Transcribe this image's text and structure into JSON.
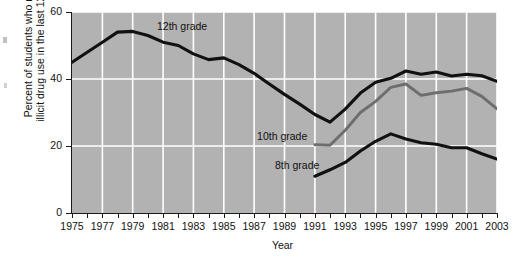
{
  "chart_data": {
    "type": "line",
    "title": "",
    "xlabel": "Year",
    "ylabel": "Percent of students who reported illicit drug use in the last 12 months",
    "ylabel_line1": "Percent of students who reported",
    "ylabel_line2": "illicit drug use in the last 12 months",
    "xlim": [
      1975,
      2003
    ],
    "ylim": [
      0,
      60
    ],
    "yticks": [
      0,
      20,
      40,
      60
    ],
    "ytick_labels": [
      "0",
      "20",
      "40",
      "60"
    ],
    "xticks": [
      1975,
      1976,
      1977,
      1978,
      1979,
      1980,
      1981,
      1982,
      1983,
      1984,
      1985,
      1986,
      1987,
      1988,
      1989,
      1990,
      1991,
      1992,
      1993,
      1994,
      1995,
      1996,
      1997,
      1998,
      1999,
      2000,
      2001,
      2002,
      2003
    ],
    "xtick_labels": [
      "1975",
      "1977",
      "1979",
      "1981",
      "1983",
      "1985",
      "1987",
      "1989",
      "1991",
      "1993",
      "1995",
      "1997",
      "1999",
      "2001",
      "2003"
    ],
    "xtick_labeled_years": [
      1975,
      1977,
      1979,
      1981,
      1983,
      1985,
      1987,
      1989,
      1991,
      1993,
      1995,
      1997,
      1999,
      2001,
      2003
    ],
    "grid": true,
    "grid_color": "#ffffff",
    "plot_background": "#b2b2b2",
    "legend_position": "inline-annotations",
    "series": [
      {
        "name": "12th grade",
        "color": "#111111",
        "label_x": 1980.6,
        "label_y": 55.5,
        "x": [
          1975,
          1976,
          1977,
          1978,
          1979,
          1980,
          1981,
          1982,
          1983,
          1984,
          1985,
          1986,
          1987,
          1988,
          1989,
          1990,
          1991,
          1992,
          1993,
          1994,
          1995,
          1996,
          1997,
          1998,
          1999,
          2000,
          2001,
          2002,
          2003
        ],
        "values": [
          45,
          48,
          51,
          54,
          54.2,
          53,
          51,
          50,
          47.5,
          45.8,
          46.3,
          44.3,
          41.7,
          38.5,
          35.4,
          32.5,
          29.4,
          27.1,
          31,
          35.8,
          39,
          40.2,
          42.4,
          41.4,
          42.1,
          40.9,
          41.4,
          41,
          39.3
        ]
      },
      {
        "name": "10th grade",
        "color": "#6e6e6e",
        "label_x": 1990.5,
        "label_y": 22.8,
        "x": [
          1991,
          1992,
          1993,
          1994,
          1995,
          1996,
          1997,
          1998,
          1999,
          2000,
          2001,
          2002,
          2003
        ],
        "values": [
          20.4,
          20.2,
          24.7,
          30,
          33.3,
          37.5,
          38.5,
          35.1,
          35.9,
          36.4,
          37.2,
          34.8,
          31.1
        ]
      },
      {
        "name": "8th grade",
        "color": "#111111",
        "label_x": 1991.3,
        "label_y": 14.0,
        "x": [
          1991,
          1992,
          1993,
          1994,
          1995,
          1996,
          1997,
          1998,
          1999,
          2000,
          2001,
          2002,
          2003
        ],
        "values": [
          11,
          12.9,
          15.1,
          18.5,
          21.4,
          23.6,
          22.1,
          21,
          20.5,
          19.5,
          19.5,
          17.7,
          16.1
        ]
      }
    ]
  },
  "axes": {
    "y_title_line1": "Percent of students who reported",
    "y_title_line2": "illicit drug use in the last 12 months",
    "x_title": "Year"
  }
}
